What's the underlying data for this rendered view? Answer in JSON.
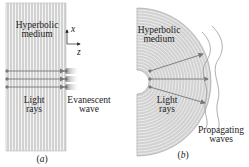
{
  "panel_a": {
    "medium_label_1": "Hyperbolic",
    "medium_label_2": "medium",
    "rays_label_1": "Light",
    "rays_label_2": "rays",
    "wave_label_1": "Evanescent",
    "wave_label_2": "wave",
    "axis_x": "x",
    "axis_z": "z",
    "caption": "(a)"
  },
  "panel_b": {
    "medium_label_1": "Hyperbolic",
    "medium_label_2": "medium",
    "rays_label_1": "Light",
    "rays_label_2": "rays",
    "wave_label_1": "Propagating",
    "wave_label_2": "waves",
    "caption": "(b)"
  },
  "colors": {
    "medium_fill": "#d4d4d4",
    "stripe": "#f2f2f2",
    "ray": "#777777",
    "text": "#222222"
  }
}
